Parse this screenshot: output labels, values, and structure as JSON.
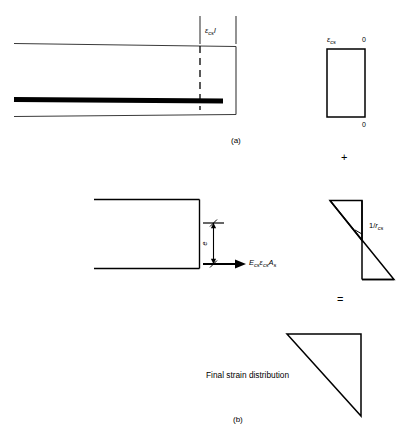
{
  "figure": {
    "caption_a": "(a)",
    "caption_b": "(b)",
    "operator_plus": "+",
    "operator_equals": "="
  },
  "panel_a": {
    "beam": {
      "strain_dimension_label": {
        "symbol": "ε",
        "subscript": "cs",
        "trailing": "l"
      }
    },
    "strain_block": {
      "top_left_label": {
        "symbol": "ε",
        "subscript": "cs"
      },
      "top_right_label": "0",
      "bottom_right_label": "0"
    }
  },
  "panel_b": {
    "section": {
      "eccentricity_label": "e",
      "force_label": {
        "modulus": "E",
        "modulus_sub": "cs",
        "strain": "ε",
        "strain_sub": "cs",
        "area": "A",
        "area_sub": "s"
      }
    },
    "curvature": {
      "label_prefix": "1/",
      "label_symbol": "r",
      "label_subscript": "cs"
    },
    "final": {
      "description": "Final strain distribution"
    }
  },
  "colors": {
    "ink": "#000000",
    "paper": "#ffffff",
    "thin_line": "#3a3a3a",
    "rebar": "#000000"
  }
}
